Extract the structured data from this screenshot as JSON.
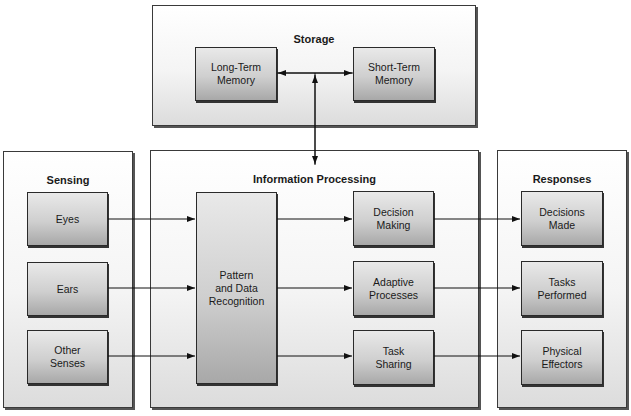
{
  "storage": {
    "title": "Storage",
    "long_term": "Long-Term\nMemory",
    "short_term": "Short-Term\nMemory"
  },
  "sensing": {
    "title": "Sensing",
    "items": [
      "Eyes",
      "Ears",
      "Other\nSenses"
    ]
  },
  "processing": {
    "title": "Information Processing",
    "pattern": "Pattern\nand Data\nRecognition",
    "items": [
      "Decision\nMaking",
      "Adaptive\nProcesses",
      "Task\nSharing"
    ]
  },
  "responses": {
    "title": "Responses",
    "items": [
      "Decisions\nMade",
      "Tasks\nPerformed",
      "Physical\nEffectors"
    ]
  }
}
